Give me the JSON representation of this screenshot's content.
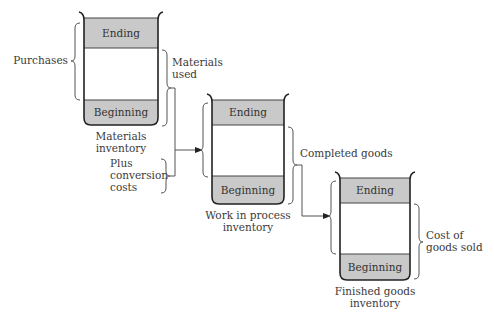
{
  "diagram": {
    "colors": {
      "shaded": "#c9c9c9",
      "outline": "#2a2a2a",
      "line": "#555555",
      "text": "#3a3a3a"
    },
    "containers": [
      {
        "id": "materials",
        "top_label": "Ending",
        "bottom_label": "Beginning",
        "caption": [
          "Materials",
          "inventory"
        ]
      },
      {
        "id": "wip",
        "top_label": "Ending",
        "bottom_label": "Beginning",
        "caption": [
          "Work in process",
          "inventory"
        ]
      },
      {
        "id": "finished",
        "top_label": "Ending",
        "bottom_label": "Beginning",
        "caption": [
          "Finished goods",
          "inventory"
        ]
      }
    ],
    "annotations": {
      "purchases": "Purchases",
      "materials_used": [
        "Materials",
        "used"
      ],
      "plus_conversion": [
        "Plus",
        "conversion",
        "costs"
      ],
      "completed_goods": "Completed goods",
      "cost_of_goods_sold": [
        "Cost of",
        "goods sold"
      ]
    }
  }
}
